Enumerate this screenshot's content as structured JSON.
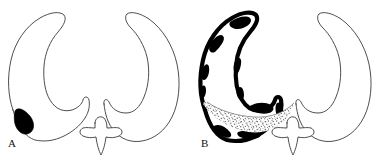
{
  "figure": {
    "kind": "line-drawing",
    "background_color": "#ffffff",
    "outline_color": "#3a3a3a",
    "fill_color": "#ffffff",
    "lesion_color": "#000000",
    "stipple_color": "#2b2b2b",
    "width": 385,
    "height": 163
  },
  "panels": [
    {
      "id": "A",
      "label": "A",
      "label_position": {
        "x": 8,
        "y": 138
      },
      "structures": [
        {
          "name": "left-lateral-ventricle",
          "outline": "thin",
          "fill": "white",
          "marking": "solid-black-lesion",
          "marking_location": "inferolateral margin"
        },
        {
          "name": "right-lateral-ventricle",
          "outline": "thin",
          "fill": "white",
          "marking": "none"
        },
        {
          "name": "third-ventricle",
          "outline": "thin",
          "fill": "white",
          "marking": "none",
          "shape": "star"
        }
      ]
    },
    {
      "id": "B",
      "label": "B",
      "label_position": {
        "x": 201,
        "y": 138
      },
      "structures": [
        {
          "name": "left-lateral-ventricle",
          "outline": "thick-black-irregular",
          "fill": "white",
          "marking": "stippled-sediment-layer",
          "marking_location": "dependent inferior portion"
        },
        {
          "name": "right-lateral-ventricle",
          "outline": "thin",
          "fill": "white",
          "marking": "none"
        },
        {
          "name": "third-ventricle",
          "outline": "thin",
          "fill": "white",
          "marking": "none",
          "shape": "star"
        }
      ]
    }
  ]
}
